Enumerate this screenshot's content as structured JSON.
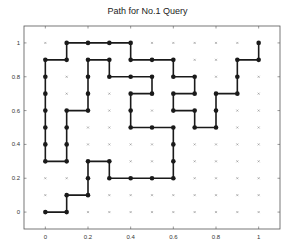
{
  "chart_data": {
    "type": "line",
    "title": "Path for No.1 Query",
    "xlabel": "",
    "ylabel": "",
    "xlim": [
      -0.1,
      1.1
    ],
    "ylim": [
      -0.1,
      1.1
    ],
    "xticks": [
      0,
      0.2,
      0.4,
      0.6,
      0.8,
      1
    ],
    "xtick_labels": [
      "0",
      "0.2",
      "0.4",
      "0.6",
      "0.8",
      "1"
    ],
    "yticks": [
      0,
      0.2,
      0.4,
      0.6,
      0.8,
      1
    ],
    "ytick_labels": [
      "0",
      "0.2",
      "0.4",
      "0.6",
      "0.8",
      "1"
    ],
    "grid": false,
    "legend": null,
    "background_points": {
      "description": "11x11 grid of small x markers at every 0.1 step from 0 to 1",
      "x_values": [
        0,
        0.1,
        0.2,
        0.3,
        0.4,
        0.5,
        0.6,
        0.7,
        0.8,
        0.9,
        1
      ],
      "y_values": [
        0,
        0.1,
        0.2,
        0.3,
        0.4,
        0.5,
        0.6,
        0.7,
        0.8,
        0.9,
        1
      ],
      "marker": "x"
    },
    "series": [
      {
        "name": "path",
        "marker": "o",
        "color": "#1a1a1a",
        "points": [
          [
            0,
            0
          ],
          [
            0.1,
            0
          ],
          [
            0.1,
            0.1
          ],
          [
            0.2,
            0.1
          ],
          [
            0.2,
            0.2
          ],
          [
            0.2,
            0.3
          ],
          [
            0.3,
            0.3
          ],
          [
            0.3,
            0.2
          ],
          [
            0.4,
            0.2
          ],
          [
            0.5,
            0.2
          ],
          [
            0.6,
            0.2
          ],
          [
            0.6,
            0.3
          ],
          [
            0.6,
            0.4
          ],
          [
            0.6,
            0.5
          ],
          [
            0.5,
            0.5
          ],
          [
            0.4,
            0.5
          ],
          [
            0.4,
            0.6
          ],
          [
            0.4,
            0.7
          ],
          [
            0.5,
            0.7
          ],
          [
            0.5,
            0.8
          ],
          [
            0.4,
            0.8
          ],
          [
            0.3,
            0.8
          ],
          [
            0.3,
            0.9
          ],
          [
            0.2,
            0.9
          ],
          [
            0.2,
            0.8
          ],
          [
            0.2,
            0.7
          ],
          [
            0.2,
            0.6
          ],
          [
            0.1,
            0.6
          ],
          [
            0.1,
            0.5
          ],
          [
            0.1,
            0.4
          ],
          [
            0.1,
            0.3
          ],
          [
            0,
            0.3
          ],
          [
            0,
            0.4
          ],
          [
            0,
            0.5
          ],
          [
            0,
            0.6
          ],
          [
            0,
            0.7
          ],
          [
            0,
            0.8
          ],
          [
            0,
            0.9
          ],
          [
            0.1,
            0.9
          ],
          [
            0.1,
            1
          ],
          [
            0.2,
            1
          ],
          [
            0.3,
            1
          ],
          [
            0.4,
            1
          ],
          [
            0.4,
            0.9
          ],
          [
            0.5,
            0.9
          ],
          [
            0.6,
            0.9
          ],
          [
            0.6,
            0.8
          ],
          [
            0.7,
            0.8
          ],
          [
            0.7,
            0.7
          ],
          [
            0.6,
            0.7
          ],
          [
            0.6,
            0.6
          ],
          [
            0.7,
            0.6
          ],
          [
            0.7,
            0.5
          ],
          [
            0.8,
            0.5
          ],
          [
            0.8,
            0.6
          ],
          [
            0.8,
            0.7
          ],
          [
            0.9,
            0.7
          ],
          [
            0.9,
            0.8
          ],
          [
            0.9,
            0.9
          ],
          [
            1,
            0.9
          ],
          [
            1,
            1
          ]
        ]
      }
    ]
  }
}
